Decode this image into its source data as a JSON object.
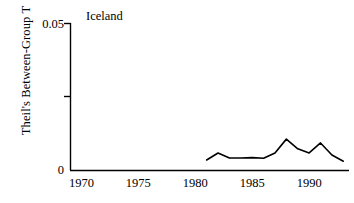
{
  "chart_data": {
    "type": "line",
    "title": "Iceland",
    "xlabel": "",
    "ylabel": "Theil's Between-Group T",
    "xlim": [
      1969,
      1993.5
    ],
    "ylim": [
      0,
      0.05
    ],
    "grid": false,
    "legend": null,
    "y_ticks": [
      {
        "value": 0.05,
        "label": "0.05"
      },
      {
        "value": 0.025,
        "label": ""
      },
      {
        "value": 0,
        "label": "0"
      }
    ],
    "x_ticks": [
      {
        "value": 1970,
        "label": "1970"
      },
      {
        "value": 1975,
        "label": "1975"
      },
      {
        "value": 1980,
        "label": "1980"
      },
      {
        "value": 1985,
        "label": "1985"
      },
      {
        "value": 1990,
        "label": "1990"
      }
    ],
    "series": [
      {
        "name": "Iceland",
        "color": "#000000",
        "x": [
          1981,
          1982,
          1983,
          1984,
          1985,
          1986,
          1987,
          1988,
          1989,
          1990,
          1991,
          1992,
          1993
        ],
        "values": [
          0.0034,
          0.0058,
          0.0041,
          0.0041,
          0.0042,
          0.004,
          0.0058,
          0.0105,
          0.0072,
          0.0058,
          0.0092,
          0.0051,
          0.003
        ]
      }
    ]
  }
}
